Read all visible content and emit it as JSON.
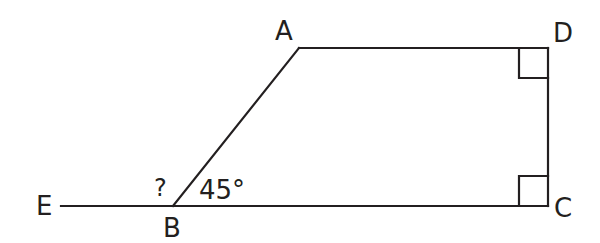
{
  "diagram": {
    "type": "geometry",
    "stroke_color": "#231f20",
    "points": {
      "A": {
        "label": "A"
      },
      "B": {
        "label": "B"
      },
      "C": {
        "label": "C"
      },
      "D": {
        "label": "D"
      },
      "E": {
        "label": "E"
      }
    },
    "angles": {
      "unknown": {
        "label": "?"
      },
      "ABC": {
        "label": "45°"
      }
    },
    "right_angles": [
      "D",
      "C"
    ]
  }
}
